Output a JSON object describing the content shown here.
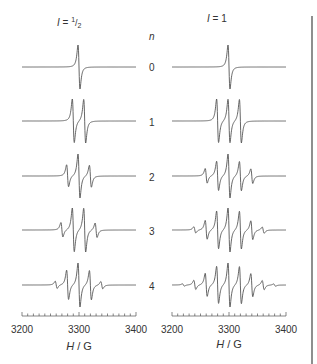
{
  "chart_data": {
    "type": "line",
    "title": "",
    "panels": [
      {
        "title_prefix": "I = ",
        "title_value": "1/2",
        "title_num": "1",
        "title_den": "2",
        "nuclear_spin": 0.5
      },
      {
        "title_prefix": "I = ",
        "title_value": "1",
        "nuclear_spin": 1
      }
    ],
    "row_header": "n",
    "rows": [
      0,
      1,
      2,
      3,
      4
    ],
    "xlabel_var": "H",
    "xlabel_unit": "G",
    "xlabel": "H / G",
    "xlim": [
      3200,
      3400
    ],
    "x_ticks": [
      3200,
      3300,
      3400
    ],
    "minor_tick_step": 10,
    "center_field": 3300,
    "hyperfine_coupling_G": 20,
    "linewidth_G": 3,
    "series": [
      {
        "panel": "I = 1/2",
        "n": 0,
        "lines": 1,
        "intensities": [
          1
        ]
      },
      {
        "panel": "I = 1/2",
        "n": 1,
        "lines": 2,
        "intensities": [
          1,
          1
        ]
      },
      {
        "panel": "I = 1/2",
        "n": 2,
        "lines": 3,
        "intensities": [
          1,
          2,
          1
        ]
      },
      {
        "panel": "I = 1/2",
        "n": 3,
        "lines": 4,
        "intensities": [
          1,
          3,
          3,
          1
        ]
      },
      {
        "panel": "I = 1/2",
        "n": 4,
        "lines": 5,
        "intensities": [
          1,
          4,
          6,
          4,
          1
        ]
      },
      {
        "panel": "I = 1",
        "n": 0,
        "lines": 1,
        "intensities": [
          1
        ]
      },
      {
        "panel": "I = 1",
        "n": 1,
        "lines": 3,
        "intensities": [
          1,
          1,
          1
        ]
      },
      {
        "panel": "I = 1",
        "n": 2,
        "lines": 5,
        "intensities": [
          1,
          2,
          3,
          2,
          1
        ]
      },
      {
        "panel": "I = 1",
        "n": 3,
        "lines": 7,
        "intensities": [
          1,
          3,
          6,
          7,
          6,
          3,
          1
        ]
      },
      {
        "panel": "I = 1",
        "n": 4,
        "lines": 9,
        "intensities": [
          1,
          4,
          10,
          16,
          19,
          16,
          10,
          4,
          1
        ]
      }
    ]
  },
  "labels": {
    "left_title_prefix": "I = ",
    "left_title_num": "1",
    "left_title_den": "2",
    "right_title": "I = 1",
    "n_header": "n",
    "n_values": [
      "0",
      "1",
      "2",
      "3",
      "4"
    ],
    "tick_left": [
      "3200",
      "3300",
      "3400"
    ],
    "tick_right": [
      "3200",
      "3300",
      "3400"
    ],
    "axis_var": "H",
    "axis_sep": " / ",
    "axis_unit": "G"
  },
  "colors": {
    "trace": "#555555",
    "text": "#333333",
    "divider": "#444444"
  }
}
